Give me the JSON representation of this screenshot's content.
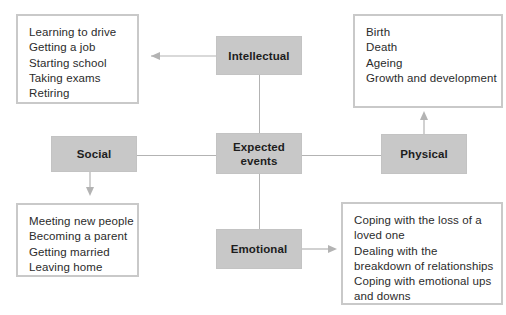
{
  "diagram": {
    "title": "Expected events",
    "colors": {
      "node_fill": "#c8c8c8",
      "box_border": "#c9c9c9",
      "connector": "#b3b3b3",
      "text": "#2b2b2b",
      "background": "#ffffff"
    },
    "center_node": {
      "id": "expected-events",
      "label_line1": "Expected",
      "label_line2": "events"
    },
    "category_nodes": [
      {
        "id": "intellectual",
        "label": "Intellectual"
      },
      {
        "id": "social",
        "label": "Social"
      },
      {
        "id": "physical",
        "label": "Physical"
      },
      {
        "id": "emotional",
        "label": "Emotional"
      }
    ],
    "example_boxes": [
      {
        "id": "intellectual-examples",
        "linked_node": "intellectual",
        "items": [
          "Learning to drive",
          "Getting a job",
          "Starting school",
          "Taking exams",
          "Retiring"
        ]
      },
      {
        "id": "physical-examples",
        "linked_node": "physical",
        "items": [
          "Birth",
          "Death",
          "Ageing",
          "Growth and development"
        ]
      },
      {
        "id": "social-examples",
        "linked_node": "social",
        "items": [
          "Meeting new people",
          "Becoming a parent",
          "Getting married",
          "Leaving home"
        ]
      },
      {
        "id": "emotional-examples",
        "linked_node": "emotional",
        "items": [
          "Coping with the loss of a",
          "loved one",
          "Dealing with the",
          "breakdown of relationships",
          "Coping with emotional ups",
          "and downs"
        ]
      }
    ],
    "connections": [
      {
        "from": "social",
        "to": "expected-events",
        "arrow": "none",
        "direction": "horizontal"
      },
      {
        "from": "expected-events",
        "to": "physical",
        "arrow": "none",
        "direction": "horizontal"
      },
      {
        "from": "intellectual",
        "to": "expected-events",
        "arrow": "none",
        "direction": "vertical"
      },
      {
        "from": "expected-events",
        "to": "emotional",
        "arrow": "none",
        "direction": "vertical"
      },
      {
        "from": "intellectual",
        "to": "intellectual-examples",
        "arrow": "left",
        "direction": "horizontal"
      },
      {
        "from": "physical",
        "to": "physical-examples",
        "arrow": "up",
        "direction": "vertical"
      },
      {
        "from": "social",
        "to": "social-examples",
        "arrow": "down",
        "direction": "vertical"
      },
      {
        "from": "emotional",
        "to": "emotional-examples",
        "arrow": "right",
        "direction": "horizontal"
      }
    ]
  }
}
